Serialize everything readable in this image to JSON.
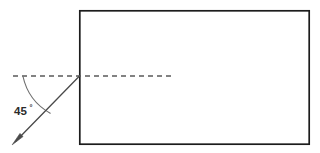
{
  "figure": {
    "type": "geometry-diagram",
    "background_color": "#ffffff",
    "title_text": "",
    "annotations": [
      {
        "name": "angle-label",
        "value": "45",
        "unit": "°",
        "full_text": "45°",
        "x": 23,
        "y": 111,
        "color": "#2b2b2b"
      }
    ],
    "shapes": {
      "rectangle": {
        "name": "rectangle",
        "x": 79,
        "y": 10,
        "width": 231,
        "height": 135,
        "stroke_color": "#1c1c1c",
        "stroke_width": 1.6,
        "fill": "none"
      },
      "dashed_reference_line": {
        "name": "horizontal-dashed-line",
        "x1": 13,
        "y1": 76,
        "x2": 173,
        "y2": 76,
        "stroke_color": "#5a5a5a",
        "stroke_width": 1.3,
        "dash_pattern": "5 4"
      },
      "incident_ray": {
        "name": "diagonal-ray",
        "x1": 79,
        "y1": 76,
        "x2": 13,
        "y2": 144,
        "stroke_color": "#4a4a4a",
        "stroke_width": 1.2,
        "arrow_at": "end",
        "angle_degrees": 45
      },
      "angle_arc": {
        "name": "angle-arc",
        "center_x": 79,
        "center_y": 76,
        "radius": 56,
        "start_x": 23,
        "start_y": 76,
        "end_x": 50,
        "end_y": 113,
        "stroke_color": "#6a6a6a",
        "stroke_width": 1.1
      },
      "arrowhead": {
        "name": "arrowhead",
        "tip_x": 13,
        "tip_y": 144,
        "color": "#4a4a4a"
      }
    }
  }
}
